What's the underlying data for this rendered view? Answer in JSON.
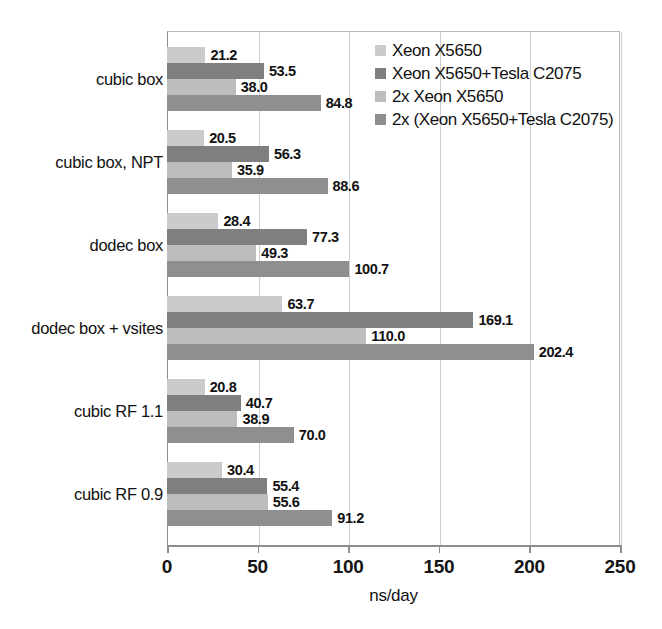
{
  "chart_data": {
    "type": "bar",
    "orientation": "horizontal",
    "title": "",
    "xlabel": "ns/day",
    "ylabel": "",
    "xlim": [
      0,
      250
    ],
    "xticks": [
      0,
      50,
      100,
      150,
      200,
      250
    ],
    "xtick_labels": [
      "0",
      "50",
      "100",
      "150",
      "200",
      "250"
    ],
    "grid": true,
    "grid_axis": "x",
    "legend_position": "top-right-inside",
    "categories": [
      "cubic box",
      "cubic box, NPT",
      "dodec box",
      "dodec box + vsites",
      "cubic RF 1.1",
      "cubic RF 0.9"
    ],
    "series": [
      {
        "name": "Xeon X5650",
        "color": "#cbcbcb",
        "values": [
          21.2,
          20.5,
          28.4,
          63.7,
          20.8,
          30.4
        ],
        "labels": [
          "21.2",
          "20.5",
          "28.4",
          "63.7",
          "20.8",
          "30.4"
        ]
      },
      {
        "name": "Xeon X5650+Tesla C2075",
        "color": "#7f7f7f",
        "values": [
          53.5,
          56.3,
          77.3,
          169.1,
          40.7,
          55.4
        ],
        "labels": [
          "53.5",
          "56.3",
          "77.3",
          "169.1",
          "40.7",
          "55.4"
        ]
      },
      {
        "name": "2x Xeon X5650",
        "color": "#bdbdbd",
        "values": [
          38.0,
          35.9,
          49.3,
          110.0,
          38.9,
          55.6
        ],
        "labels": [
          "38.0",
          "35.9",
          "49.3",
          "110.0",
          "38.9",
          "55.6"
        ]
      },
      {
        "name": "2x (Xeon X5650+Tesla C2075)",
        "color": "#8f8f8f",
        "values": [
          84.8,
          88.6,
          100.7,
          202.4,
          70.0,
          91.2
        ],
        "labels": [
          "84.8",
          "88.6",
          "100.7",
          "202.4",
          "70.0",
          "91.2"
        ]
      }
    ]
  }
}
